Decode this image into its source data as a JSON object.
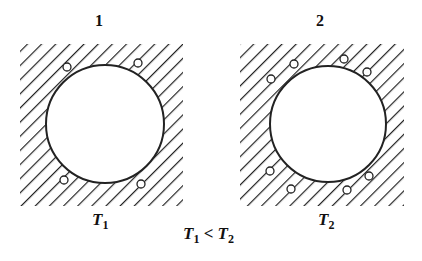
{
  "panels": [
    {
      "number": "1",
      "temp_symbol": "T",
      "temp_subscript": "1",
      "pores": 4
    },
    {
      "number": "2",
      "temp_symbol": "T",
      "temp_subscript": "2",
      "pores": 8
    }
  ],
  "relation": {
    "left": "T",
    "left_sub": "1",
    "op": "<",
    "right": "T",
    "right_sub": "2"
  },
  "colors": {
    "line": "#222222",
    "background": "#ffffff"
  }
}
